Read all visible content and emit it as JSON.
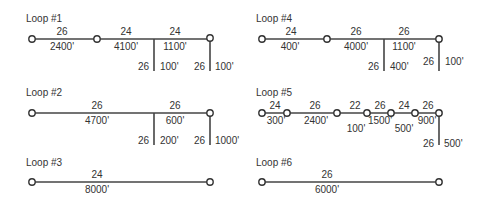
{
  "loops": [
    {
      "title": "Loop #1",
      "segments": [
        {
          "size": "26",
          "length": "2400'"
        },
        {
          "size": "24",
          "length": "4100'"
        },
        {
          "size": "24",
          "length": "1100'"
        }
      ],
      "branches": [
        {
          "size": "26",
          "length": "100'"
        },
        {
          "size": "26",
          "length": "100'"
        }
      ]
    },
    {
      "title": "Loop #2",
      "segments": [
        {
          "size": "26",
          "length": "4700'"
        },
        {
          "size": "26",
          "length": "600'"
        }
      ],
      "branches": [
        {
          "size": "26",
          "length": "200'"
        },
        {
          "size": "26",
          "length": "1000'"
        }
      ]
    },
    {
      "title": "Loop #3",
      "segments": [
        {
          "size": "24",
          "length": "8000'"
        }
      ],
      "branches": []
    },
    {
      "title": "Loop #4",
      "segments": [
        {
          "size": "24",
          "length": "400'"
        },
        {
          "size": "26",
          "length": "4000'"
        },
        {
          "size": "26",
          "length": "1100'"
        }
      ],
      "branches": [
        {
          "size": "26",
          "length": "400'"
        },
        {
          "size": "26",
          "length": "100'"
        }
      ]
    },
    {
      "title": "Loop #5",
      "segments": [
        {
          "size": "24",
          "length": "300'"
        },
        {
          "size": "26",
          "length": "2400'"
        },
        {
          "size": "22",
          "length": "100'"
        },
        {
          "size": "26",
          "length": "1500'"
        },
        {
          "size": "24",
          "length": "500'"
        },
        {
          "size": "26",
          "length": "900'"
        }
      ],
      "branches": [
        {
          "size": "26",
          "length": "500'"
        }
      ]
    },
    {
      "title": "Loop #6",
      "segments": [
        {
          "size": "26",
          "length": "6000'"
        }
      ],
      "branches": []
    }
  ]
}
